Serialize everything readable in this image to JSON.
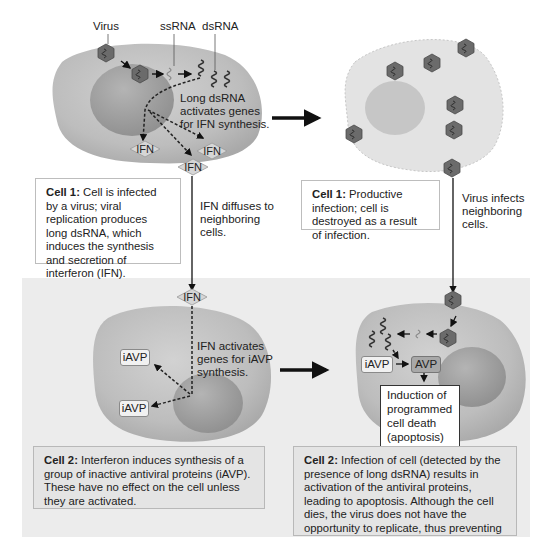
{
  "labels": {
    "virus": "Virus",
    "ssrna": "ssRNA",
    "dsrna": "dsRNA",
    "long_dsrna_note": [
      "Long dsRNA",
      "activates genes",
      "for IFN synthesis."
    ],
    "ifn_diffuses": [
      "IFN diffuses to",
      "neighboring",
      "cells."
    ],
    "virus_infects": [
      "Virus infects",
      "neighboring",
      "cells."
    ],
    "ifn_activates": [
      "IFN activates",
      "genes for iAVP",
      "synthesis."
    ]
  },
  "tags": {
    "ifn": "IFN",
    "iavp": "iAVP",
    "avp": "AVP"
  },
  "apoptosis_box": [
    "Induction of",
    "programmed",
    "cell death",
    "(apoptosis)"
  ],
  "captions": {
    "cell1_left": {
      "title": "Cell 1:",
      "text": "Cell is infected by a virus; viral replication produces long dsRNA, which induces the synthesis and secretion of interferon (IFN)."
    },
    "cell1_right": {
      "title": "Cell 1:",
      "text": "Productive infection; cell is destroyed as a result of infection."
    },
    "cell2_left": {
      "title": "Cell 2:",
      "text": "Interferon induces synthesis of a group of inactive antiviral proteins (iAVP). These have no effect on the cell unless they are activated."
    },
    "cell2_right": {
      "title": "Cell 2:",
      "text": "Infection of cell (detected by the presence of long dsRNA) results in activation of the antiviral proteins, leading to apoptosis. Although the cell dies, the virus does not have the opportunity to replicate, thus preventing viral spread."
    }
  },
  "colors": {
    "cell_fill": "#b9b9b9",
    "nucleus_fill": "#9c9c9c",
    "dead_cell_fill": "#e2e2e2",
    "virus_fill": "#6b6b6b",
    "panel_bg": "#ececec",
    "arrow": "#111111"
  }
}
